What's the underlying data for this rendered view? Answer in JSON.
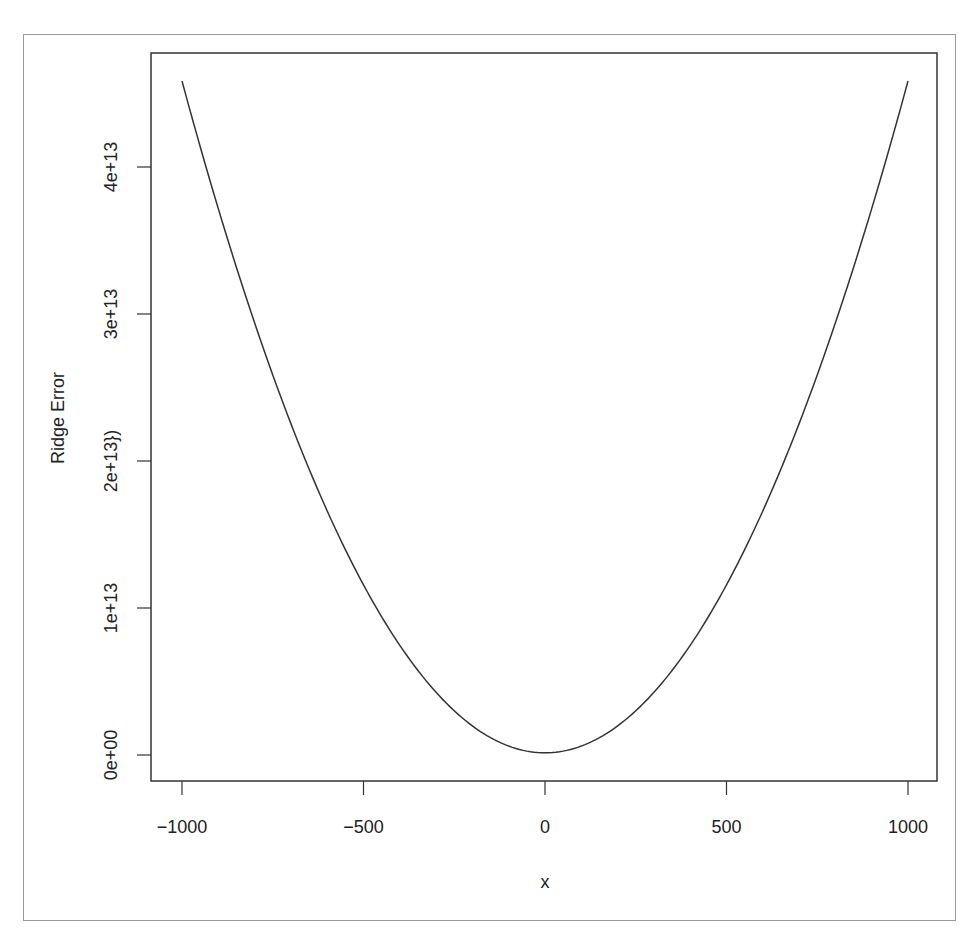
{
  "chart_data": {
    "type": "line",
    "title": "",
    "xlabel": "x",
    "ylabel": "Ridge Error",
    "xlim": [
      -1000,
      1000
    ],
    "ylim": [
      0,
      46000000000000
    ],
    "grid": false,
    "legend": null,
    "x_ticks": [
      {
        "value": -1000,
        "label": "−1000"
      },
      {
        "value": -500,
        "label": "−500"
      },
      {
        "value": 0,
        "label": "0"
      },
      {
        "value": 500,
        "label": "500"
      },
      {
        "value": 1000,
        "label": "1000"
      }
    ],
    "y_ticks": [
      {
        "value": 0,
        "label": "0e+00"
      },
      {
        "value": 10000000000000,
        "label": "1e+13"
      },
      {
        "value": 20000000000000,
        "label": "2e+13})"
      },
      {
        "value": 30000000000000,
        "label": "3e+13"
      },
      {
        "value": 40000000000000,
        "label": "4e+13"
      }
    ],
    "series": [
      {
        "name": "ridge_error",
        "color": "#333333",
        "formula": "4.57e13*(x/1000)^2 + 1.5e11",
        "x": [
          -1000,
          -750,
          -500,
          -250,
          0,
          250,
          500,
          750,
          1000
        ],
        "values": [
          45850000000000,
          25860000000000,
          11580000000000,
          3010000000000,
          150000000000,
          3010000000000,
          11580000000000,
          25860000000000,
          45850000000000
        ]
      }
    ]
  }
}
